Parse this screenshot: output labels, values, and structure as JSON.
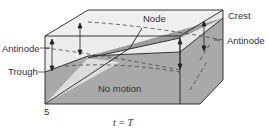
{
  "diagram": {
    "type": "standing-wave-surface",
    "labels": {
      "antinode_left": "Antinode",
      "trough": "Trough",
      "node": "Node",
      "crest": "Crest",
      "antinode_right": "Antinode",
      "no_motion": "No motion",
      "figure_number": "5",
      "time_caption": "t = T"
    },
    "colors": {
      "box_face": "#e8e8e8",
      "box_edge": "#222222",
      "surface_dark": "#a9a9a9",
      "surface_light": "#dedede",
      "text": "#333333",
      "dashed": "#444444"
    }
  }
}
